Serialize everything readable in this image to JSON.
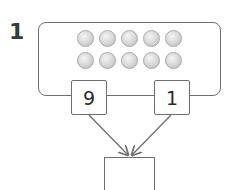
{
  "question": {
    "number": "1",
    "counters": {
      "rows": 2,
      "per_row": 5,
      "total": 10,
      "color": "#d6d6d6"
    },
    "parts": [
      {
        "label": "left-part",
        "value": "9"
      },
      {
        "label": "right-part",
        "value": "1"
      }
    ],
    "whole": {
      "value": ""
    }
  }
}
